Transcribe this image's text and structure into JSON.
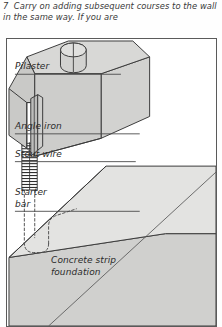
{
  "caption": {
    "step_number": "7",
    "text": "7  Carry on adding subsequent courses to the wall in the same way. If you are"
  },
  "figure": {
    "labels": {
      "pilaster": "Pilaster",
      "angle_iron": "Angle iron",
      "stout_wire": "Stout wire",
      "starter_bar": "Starter\nbar",
      "concrete_foundation": "Concrete strip\nfoundation"
    },
    "colors": {
      "outline": "#3b3b3b",
      "block_top_face": "#d8d8d6",
      "block_left_face": "#c9c9c7",
      "block_right_face": "#d2d2d0",
      "foundation_top": "#e3e3e1",
      "foundation_side": "#d0d0ce",
      "wire_coil": "#2f2f2f",
      "frame_border": "#5a5a5a",
      "leader_line": "#4a4a4a",
      "dashed_bar": "#555555",
      "page_background": "#fefefe"
    },
    "parts": {
      "pilaster_block": "isometric concrete pilaster block with cylindrical socket on top face",
      "cylinder_socket": "circular hole in top of pilaster block",
      "angle_iron": "vertical L-section steel running down front corner of block",
      "stout_wire": "coiled binding wire wrapped around starter bar",
      "starter_bar": "dashed vertical reinforcing bar with U-hook at base",
      "concrete_strip_foundation": "large isometric concrete slab at base"
    }
  }
}
